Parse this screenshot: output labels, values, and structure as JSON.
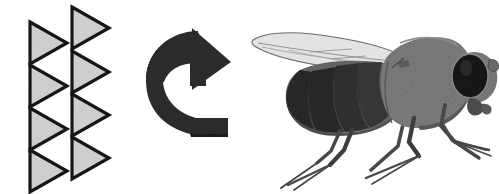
{
  "figure": {
    "title": "Motion stimulus and rotational response in a fly",
    "background_color": "#ffffff",
    "width": 499,
    "height": 194,
    "panels": [
      {
        "id": "stimulus-panel",
        "name": "triangle-stimulus-array",
        "description": "Two staggered vertical columns of right-pointing triangles representing a moving grating stimulus"
      },
      {
        "id": "rotation-panel",
        "name": "rotation-arrow",
        "description": "Curved three-dimensional arrow indicating counterclockwise body rotation"
      },
      {
        "id": "fly-panel",
        "name": "fly-illustration",
        "description": "Grayscale lateral view drawing of a fly facing right with one wing extended"
      }
    ]
  },
  "colors": {
    "background": "#ffffff",
    "triangle_fill": "#d2d2d2",
    "triangle_stroke": "#141414",
    "arrow_fill": "#2f2f2f",
    "arrow_shadow": "#1d1d1d",
    "fly_body": "#808080",
    "fly_body_dark": "#6a6a6a",
    "fly_abdomen_dark": "#2b2b2b",
    "fly_eye": "#1a1a1a",
    "fly_leg": "#4a4a4a",
    "wing_fill": "#e8e8e6",
    "wing_vein": "#7d7d7d",
    "outline": "#111111"
  },
  "stimulus": {
    "label": "triangle-grating",
    "triangle_count": 8,
    "columns": [
      {
        "name": "left-column",
        "x_left": 28,
        "triangles": [
          {
            "index": 1,
            "x": 28,
            "y": 21,
            "width": 38,
            "height": 44
          },
          {
            "index": 2,
            "x": 28,
            "y": 63,
            "width": 38,
            "height": 44
          },
          {
            "index": 3,
            "x": 28,
            "y": 106,
            "width": 38,
            "height": 44
          },
          {
            "index": 4,
            "x": 28,
            "y": 148,
            "width": 38,
            "height": 44
          }
        ]
      },
      {
        "name": "right-column",
        "x_left": 69,
        "triangles": [
          {
            "index": 1,
            "x": 69,
            "y": 6,
            "width": 38,
            "height": 44
          },
          {
            "index": 2,
            "x": 69,
            "y": 50,
            "width": 38,
            "height": 44
          },
          {
            "index": 3,
            "x": 69,
            "y": 93,
            "width": 38,
            "height": 44
          },
          {
            "index": 4,
            "x": 69,
            "y": 136,
            "width": 38,
            "height": 44
          }
        ]
      }
    ],
    "direction": "right"
  },
  "arrow": {
    "label": "rotation-arrow",
    "shape": "curved-3d-arrow",
    "direction": "counterclockwise",
    "head_position": "top-right",
    "bounds": {
      "x": 143,
      "y": 28,
      "width": 88,
      "height": 105
    }
  },
  "fly": {
    "label": "fly-lateral-view",
    "facing": "right",
    "bounds": {
      "x": 250,
      "y": 25,
      "width": 240,
      "height": 165
    },
    "parts": [
      {
        "name": "wing",
        "description": "long translucent wing extending up and to the left with faint longitudinal veins"
      },
      {
        "name": "abdomen",
        "description": "dark banded segmented abdomen at the posterior left"
      },
      {
        "name": "thorax",
        "description": "large rounded mid gray thorax"
      },
      {
        "name": "head",
        "description": "rounded head with large dark compound eye"
      },
      {
        "name": "proboscis",
        "description": "small mouthpart below the head"
      },
      {
        "name": "antenna",
        "description": "short antenna on the front of the head"
      },
      {
        "name": "legs",
        "description": "six legs with thick femurs and thin tibiae and tarsi"
      }
    ],
    "leg_count": 6,
    "wing_count": 1,
    "abdomen_segments": 5
  }
}
